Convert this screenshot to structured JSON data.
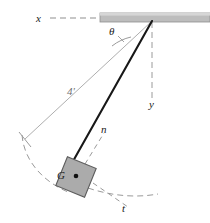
{
  "figure": {
    "type": "physics-free-body-pendulum-diagram"
  },
  "labels": {
    "x_axis": "x",
    "y_axis": "y",
    "angle": "θ",
    "rod_length": "4'",
    "normal_axis": "n",
    "tangential_axis": "t",
    "center_of_gravity": "G"
  },
  "colors": {
    "ceiling_fill": "#b5b5b5",
    "ceiling_stroke": "#8a8a8a",
    "block_fill": "#a9a9a9",
    "block_stroke": "#5a5a5a",
    "rod_stroke": "#1a1a1a",
    "guide_stroke": "#9a9a9a",
    "dashed_stroke": "#9a9a9a",
    "text": "#1a1a1a",
    "background": "#ffffff"
  },
  "geometry": {
    "pivot": {
      "x": 152,
      "y": 21
    },
    "block_center": {
      "x": 76,
      "y": 177
    },
    "rod_attach": {
      "x": 72,
      "y": 162
    },
    "guide_end": {
      "x": 25,
      "y": 139
    },
    "y_axis_end": {
      "x": 152,
      "y": 98
    },
    "block_rotation_deg": 22,
    "block_size": 31,
    "ceiling": {
      "x": 100,
      "y": 13,
      "width": 110,
      "height": 9
    }
  }
}
